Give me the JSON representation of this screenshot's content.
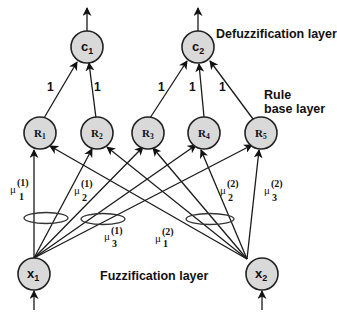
{
  "diagram": {
    "layers": {
      "defuzzification": "Defuzzification layer",
      "rule_line1": "Rule",
      "rule_line2": "base layer",
      "fuzzification": "Fuzzification layer"
    },
    "output_nodes": [
      {
        "id": "c1",
        "base": "c",
        "sub": "1"
      },
      {
        "id": "c2",
        "base": "c",
        "sub": "2"
      }
    ],
    "rule_nodes": [
      {
        "id": "R1",
        "base": "R",
        "sub": "1"
      },
      {
        "id": "R2",
        "base": "R",
        "sub": "2"
      },
      {
        "id": "R3",
        "base": "R",
        "sub": "3"
      },
      {
        "id": "R4",
        "base": "R",
        "sub": "4"
      },
      {
        "id": "R5",
        "base": "R",
        "sub": "5"
      }
    ],
    "input_nodes": [
      {
        "id": "x1",
        "base": "x",
        "sub": "1"
      },
      {
        "id": "x2",
        "base": "x",
        "sub": "2"
      }
    ],
    "rule_to_output_weights": [
      "1",
      "1",
      "1",
      "1",
      "1"
    ],
    "membership_labels": [
      {
        "mu": "μ",
        "sub": "1",
        "sup": "(1)"
      },
      {
        "mu": "μ",
        "sub": "2",
        "sup": "(1)"
      },
      {
        "mu": "μ",
        "sub": "3",
        "sup": "(1)"
      },
      {
        "mu": "μ",
        "sub": "1",
        "sup": "(2)"
      },
      {
        "mu": "μ",
        "sub": "2",
        "sup": "(2)"
      },
      {
        "mu": "μ",
        "sub": "3",
        "sup": "(2)"
      }
    ],
    "edges": {
      "input_to_rule": [
        [
          "x1",
          "R1"
        ],
        [
          "x1",
          "R2"
        ],
        [
          "x1",
          "R3"
        ],
        [
          "x1",
          "R4"
        ],
        [
          "x1",
          "R5"
        ],
        [
          "x2",
          "R1"
        ],
        [
          "x2",
          "R2"
        ],
        [
          "x2",
          "R3"
        ],
        [
          "x2",
          "R4"
        ],
        [
          "x2",
          "R5"
        ]
      ],
      "rule_to_output": [
        [
          "R1",
          "c1"
        ],
        [
          "R2",
          "c1"
        ],
        [
          "R3",
          "c2"
        ],
        [
          "R4",
          "c2"
        ],
        [
          "R5",
          "c2"
        ]
      ]
    }
  }
}
